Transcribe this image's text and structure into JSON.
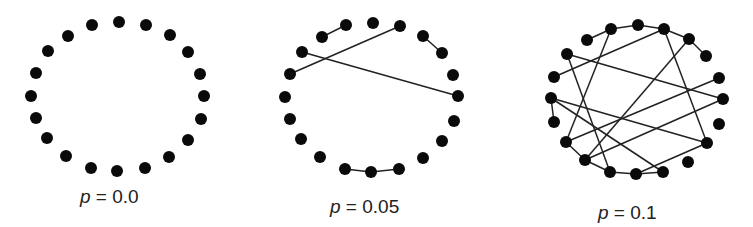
{
  "figure": {
    "node_color": "#0a0a0a",
    "edge_color": "#222222",
    "node_radius": 6,
    "panels": [
      {
        "label_var": "p",
        "label_eq": "=",
        "label_val": "0.0",
        "label_pos": [
          80,
          186
        ],
        "nodes": [
          [
            119,
            22
          ],
          [
            146,
            25
          ],
          [
            170,
            35
          ],
          [
            188,
            52
          ],
          [
            200,
            74
          ],
          [
            204,
            96
          ],
          [
            201,
            119
          ],
          [
            188,
            140
          ],
          [
            169,
            157
          ],
          [
            145,
            168
          ],
          [
            117,
            171
          ],
          [
            91,
            168
          ],
          [
            66,
            156
          ],
          [
            47,
            138
          ],
          [
            36,
            118
          ],
          [
            31,
            96
          ],
          [
            36,
            73
          ],
          [
            48,
            51
          ],
          [
            68,
            36
          ],
          [
            92,
            25
          ]
        ],
        "edges": []
      },
      {
        "label_var": "p",
        "label_eq": "=",
        "label_val": "0.05",
        "label_pos": [
          330,
          196
        ],
        "nodes": [
          [
            373,
            23
          ],
          [
            400,
            26
          ],
          [
            423,
            36
          ],
          [
            442,
            53
          ],
          [
            453,
            75
          ],
          [
            458,
            96
          ],
          [
            454,
            121
          ],
          [
            442,
            141
          ],
          [
            423,
            158
          ],
          [
            399,
            169
          ],
          [
            371,
            172
          ],
          [
            345,
            169
          ],
          [
            320,
            157
          ],
          [
            301,
            139
          ],
          [
            290,
            119
          ],
          [
            285,
            97
          ],
          [
            290,
            74
          ],
          [
            302,
            52
          ],
          [
            322,
            37
          ],
          [
            346,
            25
          ]
        ],
        "edges": [
          [
            18,
            19
          ],
          [
            1,
            16
          ],
          [
            17,
            5
          ],
          [
            2,
            3
          ],
          [
            11,
            10
          ],
          [
            10,
            9
          ]
        ]
      },
      {
        "label_var": "p",
        "label_eq": "=",
        "label_val": "0.1",
        "label_pos": [
          598,
          202
        ],
        "nodes": [
          [
            638,
            25
          ],
          [
            664,
            29
          ],
          [
            689,
            39
          ],
          [
            706,
            56
          ],
          [
            719,
            78
          ],
          [
            723,
            99
          ],
          [
            719,
            124
          ],
          [
            707,
            143
          ],
          [
            688,
            162
          ],
          [
            663,
            172
          ],
          [
            636,
            174
          ],
          [
            610,
            172
          ],
          [
            585,
            160
          ],
          [
            566,
            142
          ],
          [
            554,
            122
          ],
          [
            551,
            98
          ],
          [
            554,
            77
          ],
          [
            567,
            54
          ],
          [
            587,
            40
          ],
          [
            611,
            29
          ]
        ],
        "edges": [
          [
            18,
            19
          ],
          [
            19,
            0
          ],
          [
            0,
            1
          ],
          [
            1,
            2
          ],
          [
            2,
            3
          ],
          [
            19,
            13
          ],
          [
            17,
            11
          ],
          [
            17,
            5
          ],
          [
            16,
            1
          ],
          [
            1,
            7
          ],
          [
            2,
            12
          ],
          [
            4,
            13
          ],
          [
            5,
            12
          ],
          [
            15,
            14
          ],
          [
            15,
            7
          ],
          [
            15,
            9
          ],
          [
            13,
            12
          ],
          [
            12,
            11
          ],
          [
            11,
            10
          ],
          [
            10,
            9
          ],
          [
            10,
            7
          ]
        ]
      }
    ]
  }
}
